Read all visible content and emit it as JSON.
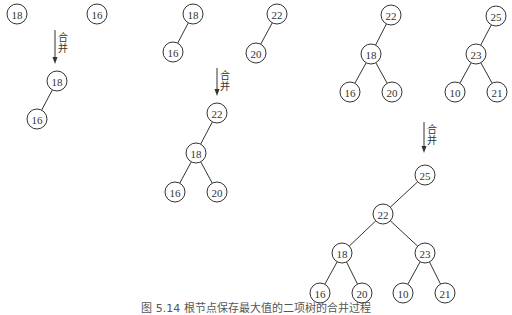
{
  "diagram": {
    "type": "binary-tree-merge",
    "merge_label": "合并",
    "nodes": [
      {
        "id": "a1",
        "value": "18",
        "x": 17,
        "y": 14
      },
      {
        "id": "a2",
        "value": "16",
        "x": 97,
        "y": 14
      },
      {
        "id": "b1",
        "value": "18",
        "x": 57,
        "y": 81
      },
      {
        "id": "b2",
        "value": "16",
        "x": 37,
        "y": 119
      },
      {
        "id": "c1",
        "value": "18",
        "x": 193,
        "y": 14
      },
      {
        "id": "c2",
        "value": "16",
        "x": 173,
        "y": 52
      },
      {
        "id": "c3",
        "value": "22",
        "x": 277,
        "y": 14
      },
      {
        "id": "c4",
        "value": "20",
        "x": 256,
        "y": 53
      },
      {
        "id": "d1",
        "value": "22",
        "x": 217,
        "y": 113
      },
      {
        "id": "d2",
        "value": "18",
        "x": 196,
        "y": 153
      },
      {
        "id": "d3",
        "value": "16",
        "x": 175,
        "y": 192
      },
      {
        "id": "d4",
        "value": "20",
        "x": 217,
        "y": 192
      },
      {
        "id": "e1",
        "value": "22",
        "x": 391,
        "y": 15
      },
      {
        "id": "e2",
        "value": "18",
        "x": 371,
        "y": 54
      },
      {
        "id": "e3",
        "value": "16",
        "x": 350,
        "y": 92
      },
      {
        "id": "e4",
        "value": "20",
        "x": 392,
        "y": 92
      },
      {
        "id": "e5",
        "value": "25",
        "x": 496,
        "y": 16
      },
      {
        "id": "e6",
        "value": "23",
        "x": 476,
        "y": 54
      },
      {
        "id": "e7",
        "value": "10",
        "x": 455,
        "y": 92
      },
      {
        "id": "e8",
        "value": "21",
        "x": 497,
        "y": 92
      },
      {
        "id": "f1",
        "value": "25",
        "x": 425,
        "y": 175
      },
      {
        "id": "f2",
        "value": "22",
        "x": 383,
        "y": 214
      },
      {
        "id": "f3",
        "value": "18",
        "x": 342,
        "y": 253
      },
      {
        "id": "f4",
        "value": "23",
        "x": 425,
        "y": 253
      },
      {
        "id": "f5",
        "value": "16",
        "x": 320,
        "y": 293
      },
      {
        "id": "f6",
        "value": "20",
        "x": 362,
        "y": 293
      },
      {
        "id": "f7",
        "value": "10",
        "x": 403,
        "y": 293
      },
      {
        "id": "f8",
        "value": "21",
        "x": 445,
        "y": 293
      }
    ],
    "edges": [
      [
        "b1",
        "b2"
      ],
      [
        "c1",
        "c2"
      ],
      [
        "c3",
        "c4"
      ],
      [
        "d1",
        "d2"
      ],
      [
        "d2",
        "d3"
      ],
      [
        "d2",
        "d4"
      ],
      [
        "e1",
        "e2"
      ],
      [
        "e2",
        "e3"
      ],
      [
        "e2",
        "e4"
      ],
      [
        "e5",
        "e6"
      ],
      [
        "e6",
        "e7"
      ],
      [
        "e6",
        "e8"
      ],
      [
        "f1",
        "f2"
      ],
      [
        "f2",
        "f3"
      ],
      [
        "f2",
        "f4"
      ],
      [
        "f3",
        "f5"
      ],
      [
        "f3",
        "f6"
      ],
      [
        "f4",
        "f7"
      ],
      [
        "f4",
        "f8"
      ]
    ],
    "arrows": [
      {
        "x": 55,
        "y1": 30,
        "y2": 64
      },
      {
        "x": 217,
        "y1": 68,
        "y2": 96
      },
      {
        "x": 424,
        "y1": 122,
        "y2": 153
      }
    ]
  },
  "caption": "图 5.14  根节点保存最大值的二项树的合并过程"
}
